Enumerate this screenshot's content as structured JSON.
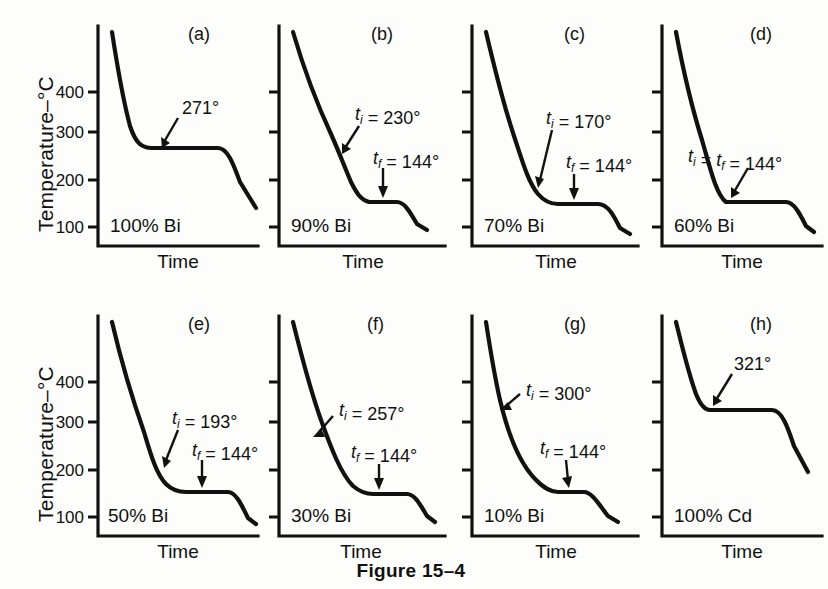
{
  "figure": {
    "caption": "Figure 15–4",
    "y_axis_title": "Temperature–°C",
    "x_axis_title": "Time",
    "tick_labels": [
      "400",
      "300",
      "200",
      "100"
    ],
    "line_color": "#111111",
    "background_color": "#fdfdfb"
  },
  "chart_data": {
    "type": "line",
    "title": "Figure 15–4",
    "xlabel": "Time",
    "ylabel": "Temperature–°C",
    "ylim": [
      0,
      480
    ],
    "ytick_labels": [
      "400",
      "300",
      "200",
      "100"
    ],
    "yticks": [
      400,
      300,
      200,
      100
    ],
    "grid": false,
    "legend": "none",
    "panels": [
      {
        "letter": "(a)",
        "composition": "100% Bi",
        "annotations": [
          "271°"
        ],
        "t_initial": 271,
        "t_final": 271,
        "start_temp": 455,
        "end_temp": 163,
        "plateau_temp": 271,
        "plateau_length": "long",
        "series": [
          {
            "name": "cooling-curve",
            "x": [
              0.0,
              0.06,
              0.13,
              0.22,
              0.3,
              0.52,
              0.73,
              0.8,
              0.88,
              1.0
            ],
            "y": [
              455,
              400,
              330,
              285,
              271,
              271,
              271,
              262,
              215,
              163
            ]
          }
        ]
      },
      {
        "letter": "(b)",
        "composition": "90% Bi",
        "annotations": [
          "t_i = 230°",
          "t_f = 144°"
        ],
        "t_initial": 230,
        "t_final": 144,
        "start_temp": 455,
        "end_temp": 110,
        "plateau_temp": 144,
        "plateau_length": "short",
        "series": [
          {
            "name": "cooling-curve",
            "x": [
              0.0,
              0.12,
              0.24,
              0.36,
              0.4,
              0.52,
              0.6,
              0.74,
              0.84,
              1.0
            ],
            "y": [
              455,
              370,
              300,
              240,
              230,
              180,
              160,
              144,
              144,
              110
            ]
          }
        ]
      },
      {
        "letter": "(c)",
        "composition": "70% Bi",
        "annotations": [
          "t_i = 170°",
          "t_f = 144°"
        ],
        "t_initial": 170,
        "t_final": 144,
        "start_temp": 455,
        "end_temp": 105,
        "plateau_temp": 144,
        "plateau_length": "medium",
        "series": [
          {
            "name": "cooling-curve",
            "x": [
              0.0,
              0.1,
              0.2,
              0.3,
              0.4,
              0.46,
              0.55,
              0.62,
              0.85,
              1.0
            ],
            "y": [
              455,
              370,
              300,
              240,
              195,
              170,
              150,
              144,
              144,
              105
            ]
          }
        ]
      },
      {
        "letter": "(d)",
        "composition": "60% Bi",
        "annotations": [
          "t_i = t_f = 144°"
        ],
        "t_initial": 144,
        "t_final": 144,
        "start_temp": 455,
        "end_temp": 105,
        "plateau_temp": 144,
        "plateau_length": "longest",
        "series": [
          {
            "name": "cooling-curve",
            "x": [
              0.0,
              0.1,
              0.2,
              0.28,
              0.34,
              0.4,
              0.8,
              0.88,
              1.0
            ],
            "y": [
              455,
              370,
              285,
              220,
              175,
              144,
              144,
              130,
              105
            ]
          }
        ]
      },
      {
        "letter": "(e)",
        "composition": "50% Bi",
        "annotations": [
          "t_i = 193°",
          "t_f = 144°"
        ],
        "t_initial": 193,
        "t_final": 144,
        "start_temp": 455,
        "end_temp": 95,
        "plateau_temp": 144,
        "plateau_length": "long",
        "series": [
          {
            "name": "cooling-curve",
            "x": [
              0.0,
              0.1,
              0.2,
              0.3,
              0.38,
              0.45,
              0.55,
              0.62,
              0.86,
              1.0
            ],
            "y": [
              455,
              375,
              300,
              235,
              193,
              165,
              148,
              144,
              144,
              95
            ]
          }
        ]
      },
      {
        "letter": "(f)",
        "composition": "30% Bi",
        "annotations": [
          "t_i = 257°",
          "t_f = 144°"
        ],
        "t_initial": 257,
        "t_final": 144,
        "start_temp": 455,
        "end_temp": 100,
        "plateau_temp": 144,
        "plateau_length": "medium",
        "series": [
          {
            "name": "cooling-curve",
            "x": [
              0.0,
              0.1,
              0.22,
              0.32,
              0.45,
              0.58,
              0.66,
              0.84,
              1.0
            ],
            "y": [
              455,
              370,
              300,
              257,
              210,
              170,
              144,
              144,
              100
            ]
          }
        ]
      },
      {
        "letter": "(g)",
        "composition": "10% Bi",
        "annotations": [
          "t_i = 300°",
          "t_f = 144°"
        ],
        "t_initial": 300,
        "t_final": 144,
        "start_temp": 455,
        "end_temp": 105,
        "plateau_temp": 144,
        "plateau_length": "very short",
        "series": [
          {
            "name": "cooling-curve",
            "x": [
              0.0,
              0.08,
              0.18,
              0.28,
              0.4,
              0.54,
              0.64,
              0.72,
              0.86,
              1.0
            ],
            "y": [
              455,
              370,
              320,
              300,
              250,
              205,
              175,
              150,
              144,
              105
            ]
          }
        ]
      },
      {
        "letter": "(h)",
        "composition": "100% Cd",
        "annotations": [
          "321°"
        ],
        "t_initial": 321,
        "t_final": 321,
        "start_temp": 455,
        "end_temp": 235,
        "plateau_temp": 321,
        "plateau_length": "long",
        "series": [
          {
            "name": "cooling-curve",
            "x": [
              0.0,
              0.1,
              0.2,
              0.26,
              0.62,
              0.7,
              0.82,
              1.0
            ],
            "y": [
              455,
              400,
              345,
              321,
              321,
              300,
              265,
              235
            ]
          }
        ]
      }
    ]
  }
}
